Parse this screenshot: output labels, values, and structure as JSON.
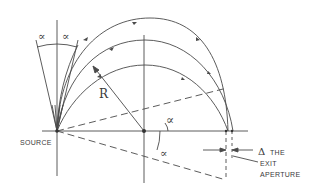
{
  "diagram": {
    "type": "magnetic sector focusing geometry",
    "labels": {
      "source": "SOURCE",
      "radius": "R",
      "alpha_left": "∝",
      "alpha_right": "∝",
      "alpha_upper": "∝",
      "alpha_lower": "∝",
      "delta": "Δ",
      "exit_line1": "THE",
      "exit_line2": "EXIT",
      "exit_line3": "APERTURE"
    },
    "colors": {
      "line": "#4a4a4a",
      "background": "#ffffff"
    }
  }
}
